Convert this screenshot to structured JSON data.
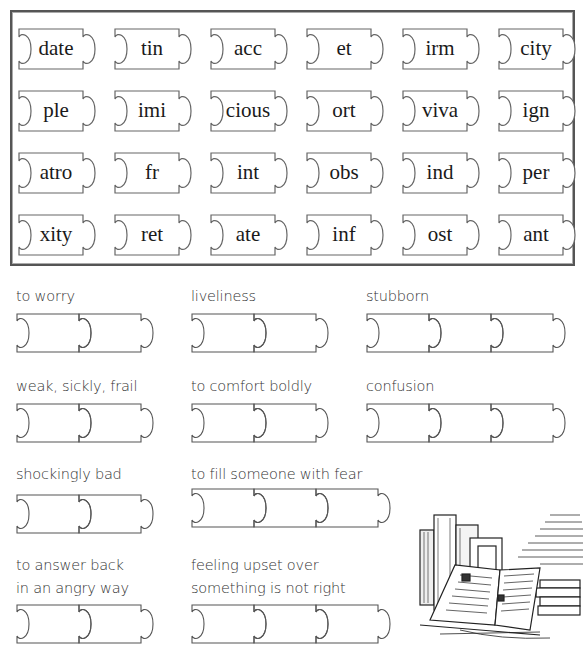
{
  "word_bank": {
    "rows": [
      [
        "date",
        "tin",
        "acc",
        "et",
        "irm",
        "city"
      ],
      [
        "ple",
        "imi",
        "cious",
        "ort",
        "viva",
        "ign"
      ],
      [
        "atro",
        "fr",
        "int",
        "obs",
        "ind",
        "per"
      ],
      [
        "xity",
        "ret",
        "ate",
        "inf",
        "ost",
        "ant"
      ]
    ]
  },
  "clues": [
    {
      "text": "to worry",
      "pieces": 2
    },
    {
      "text": "liveliness",
      "pieces": 2
    },
    {
      "text": "stubborn",
      "pieces": 3
    },
    {
      "text": "weak, sickly, frail",
      "pieces": 2
    },
    {
      "text": "to comfort boldly",
      "pieces": 2
    },
    {
      "text": "confusion",
      "pieces": 3
    },
    {
      "text": "shockingly bad",
      "pieces": 2
    },
    {
      "text": "to fill someone with fear",
      "pieces": 3
    },
    {
      "text": "to answer back",
      "text2": "in an angry way",
      "pieces": 2
    },
    {
      "text": "feeling upset over",
      "text2": "something is not right",
      "pieces": 3
    }
  ],
  "illustration": {
    "name": "stack of old books with open book and quill"
  },
  "colors": {
    "line": "#555555",
    "text": "#222222",
    "frame": "#555555"
  }
}
